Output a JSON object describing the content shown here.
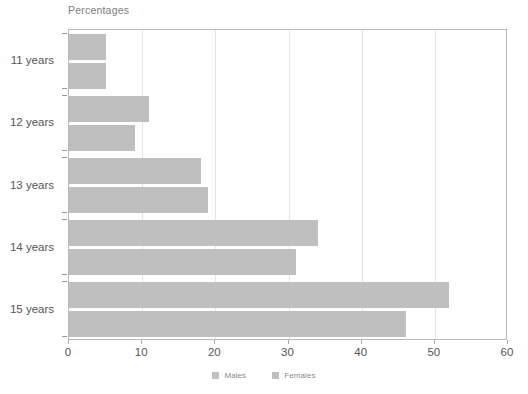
{
  "chart_data": {
    "type": "bar",
    "orientation": "horizontal",
    "title": "Percentages",
    "xlabel": "",
    "ylabel": "",
    "categories": [
      "11 years",
      "12 years",
      "13 years",
      "14 years",
      "15 years"
    ],
    "series": [
      {
        "name": "Males",
        "color": "#bfbfbf",
        "values": [
          5,
          11,
          18,
          34,
          52
        ]
      },
      {
        "name": "Females",
        "color": "#bfbfbf",
        "values": [
          5,
          9,
          19,
          31,
          46
        ]
      }
    ],
    "xlim": [
      0,
      60
    ],
    "xticks": [
      0,
      10,
      20,
      30,
      40,
      50,
      60
    ],
    "xtick_labels": [
      "0",
      "10",
      "20",
      "30",
      "40",
      "50",
      "60"
    ],
    "grid": true,
    "grid_axis": "x",
    "legend_position": "bottom",
    "plot_border_color": "#b9b9b9",
    "gridline_color": "#e4e4e4",
    "text_color": "#555555"
  }
}
